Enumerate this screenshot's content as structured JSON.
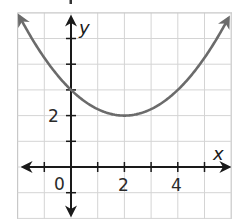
{
  "chart_data": {
    "type": "line",
    "title": "",
    "xlabel": "x",
    "ylabel": "y",
    "xlim": [
      -2,
      6
    ],
    "ylim": [
      -2,
      6
    ],
    "grid": true,
    "grid_step": 1,
    "x_tick_labels": [
      {
        "value": 0,
        "label": "0"
      },
      {
        "value": 2,
        "label": "2"
      },
      {
        "value": 4,
        "label": "4"
      }
    ],
    "y_tick_labels": [
      {
        "value": 2,
        "label": "2"
      }
    ],
    "series": [
      {
        "name": "parabola",
        "equation": "y = 0.25(x - 2)^2 + 2",
        "vertex": [
          2,
          2
        ],
        "y_intercept": [
          0,
          3
        ],
        "x": [
          -2,
          -1,
          0,
          1,
          2,
          3,
          4,
          5,
          6
        ],
        "y": [
          6,
          4.25,
          3,
          2.25,
          2,
          2.25,
          3,
          4.25,
          6
        ],
        "color": "#6b6b6b",
        "arrows_both_ends": true
      }
    ],
    "legend": null
  },
  "labels": {
    "x_axis": "x",
    "y_axis": "y",
    "x_ticks": [
      "0",
      "2",
      "4"
    ],
    "y_ticks": [
      "2"
    ]
  }
}
